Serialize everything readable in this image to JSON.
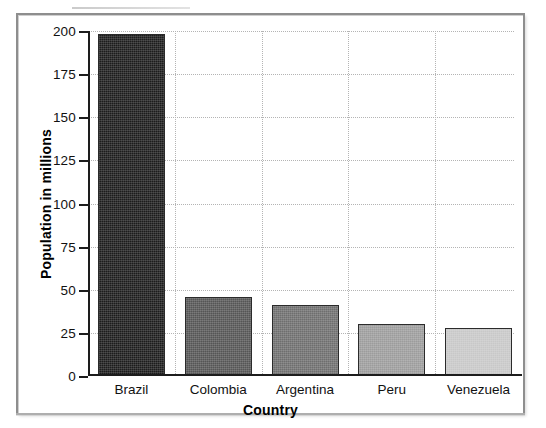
{
  "chart_data": {
    "type": "bar",
    "title": "",
    "xlabel": "Country",
    "ylabel": "Population in millions",
    "categories": [
      "Brazil",
      "Colombia",
      "Argentina",
      "Peru",
      "Venezuela"
    ],
    "values": [
      198,
      46,
      41,
      30,
      28
    ],
    "ylim": [
      0,
      200
    ],
    "yticks": [
      0,
      25,
      50,
      75,
      100,
      125,
      150,
      175,
      200
    ],
    "ytick_labels": [
      "0",
      "25",
      "50",
      "75",
      "100",
      "125",
      "150",
      "175",
      "200"
    ],
    "grid": true,
    "legend": "none",
    "bar_colors": [
      "#1c1c1c",
      "#555555",
      "#6e6e6e",
      "#9c9c9c",
      "#c8c8c8"
    ],
    "bar_edge_color": "#2b2b2b",
    "axis_color": "#1d1d1d",
    "grid_color": "#b4b4b4",
    "background": "#ffffff",
    "frame_color": "#8e8e8e"
  }
}
